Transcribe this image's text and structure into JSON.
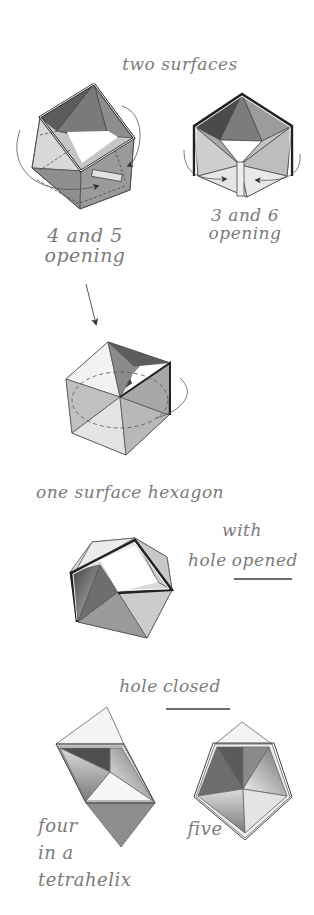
{
  "diagram": {
    "title_top": "two surfaces",
    "figures": [
      {
        "id": "fig-a",
        "label": "4 and 5\nopening",
        "description": "hexahedral kaleidocycle ring, square hole, rotation arrows on faces 4 and 5"
      },
      {
        "id": "fig-b",
        "label": "3 and 6\nopening",
        "description": "hexagonal ring, triangular hole, rotation arrows toward faces 3 and 6"
      },
      {
        "id": "fig-c",
        "label": "",
        "description": "ring collapsing into a cube with dashed circular rotation path"
      },
      {
        "id": "fig-d",
        "label_main": "one surface hexagon",
        "label_with": "with",
        "label_hole": "hole",
        "label_opened": "opened",
        "description": "hexagon ring with open pentagonal hole"
      },
      {
        "id": "fig-e",
        "label": "four\nin a\ntetrahelix",
        "description": "four tetrahedra forming a tetrahelix, hole closed"
      },
      {
        "id": "fig-f",
        "label": "five",
        "description": "five tetrahedra forming closed pentagonal ring"
      }
    ],
    "section_hole_closed": {
      "word1": "hole",
      "word2": "closed"
    },
    "colors": {
      "ink": "#7a7a7a",
      "line": "#4a4a4a",
      "dark": "#555555",
      "mid": "#8c8c8c",
      "light": "#c9c9c9",
      "pale": "#e6e6e6"
    }
  }
}
